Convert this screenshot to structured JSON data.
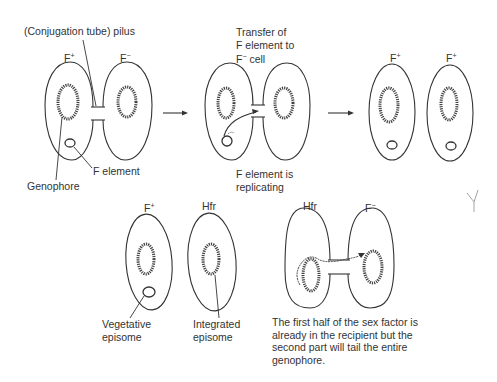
{
  "figure": {
    "top_row": {
      "panel1": {
        "label_pilus": "(Conjugation tube) pilus",
        "cell_left": {
          "label": "F",
          "superscript": "+"
        },
        "cell_right": {
          "label": "F",
          "superscript": "−"
        },
        "label_f_element": "F element",
        "label_genophore": "Genophore"
      },
      "panel2": {
        "label_transfer_line1": "Transfer of",
        "label_transfer_line2": "F element to",
        "label_transfer_line3_prefix": "F",
        "label_transfer_line3_sup": "−",
        "label_transfer_line3_suffix": " cell",
        "label_replicating_line1": "F element is",
        "label_replicating_line2": "replicating"
      },
      "panel3": {
        "cell_left": {
          "label": "F",
          "superscript": "+"
        },
        "cell_right": {
          "label": "F",
          "superscript": "+"
        }
      }
    },
    "bottom_row": {
      "panel4": {
        "cell_left": {
          "label": "F",
          "superscript": "+"
        },
        "cell_right": {
          "label": "Hfr"
        },
        "label_vegetative_line1": "Vegetative",
        "label_vegetative_line2": "episome",
        "label_integrated_line1": "Integrated",
        "label_integrated_line2": "episome"
      },
      "panel5": {
        "cell_left": {
          "label": "Hfr"
        },
        "cell_right": {
          "label": "F",
          "superscript": "−"
        },
        "caption_line1": "The first half of the sex factor is",
        "caption_line2": "already in the recipient but the",
        "caption_line3": "second part will tail the entire",
        "caption_line4": "genophore."
      }
    },
    "stray_mark": "Y"
  }
}
